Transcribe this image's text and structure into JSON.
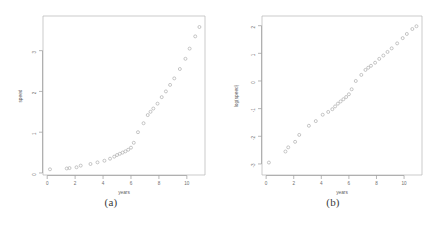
{
  "figure": {
    "panels": [
      {
        "caption": "(a)",
        "xlabel": "years",
        "ylabel": "speed"
      },
      {
        "caption": "(b)",
        "xlabel": "years",
        "ylabel": "log(speed)"
      }
    ]
  },
  "colors": {
    "marker": "#a9a9a9",
    "axis": "#9a9a9a",
    "box": "#b5b5b5",
    "text": "#6d6d6d",
    "background": "#ffffff"
  },
  "chart_data": [
    {
      "type": "scatter",
      "title": "",
      "panel": "(a)",
      "xlabel": "years",
      "ylabel": "speed",
      "xlim": [
        -0.3,
        11.3
      ],
      "ylim": [
        -0.05,
        3.85
      ],
      "xticks": [
        0,
        2,
        4,
        6,
        8,
        10
      ],
      "xticklabels": [
        "0",
        "2",
        "4",
        "6",
        "8",
        "10"
      ],
      "yticks": [
        0,
        1,
        2,
        3
      ],
      "yticklabels": [
        "0",
        "1",
        "2",
        "3"
      ],
      "grid": false,
      "legend": false,
      "marker": "open-circle",
      "x": [
        0.2,
        1.4,
        1.6,
        2.1,
        2.4,
        3.1,
        3.6,
        4.1,
        4.5,
        4.8,
        5.0,
        5.2,
        5.4,
        5.6,
        5.8,
        6.0,
        6.2,
        6.5,
        6.9,
        7.2,
        7.4,
        7.6,
        7.9,
        8.2,
        8.5,
        8.8,
        9.1,
        9.5,
        9.9,
        10.2,
        10.6,
        10.9
      ],
      "y": [
        0.09,
        0.11,
        0.12,
        0.14,
        0.18,
        0.22,
        0.26,
        0.3,
        0.35,
        0.4,
        0.44,
        0.47,
        0.5,
        0.53,
        0.57,
        0.62,
        0.74,
        1.0,
        1.22,
        1.42,
        1.5,
        1.58,
        1.7,
        1.86,
        2.0,
        2.16,
        2.32,
        2.55,
        2.8,
        3.05,
        3.35,
        3.58
      ]
    },
    {
      "type": "scatter",
      "title": "",
      "panel": "(b)",
      "xlabel": "years",
      "ylabel": "log(speed)",
      "xlim": [
        -0.3,
        11.3
      ],
      "ylim": [
        -3.4,
        2.35
      ],
      "xticks": [
        0,
        2,
        4,
        6,
        8,
        10
      ],
      "xticklabels": [
        "0",
        "2",
        "4",
        "6",
        "8",
        "10"
      ],
      "yticks": [
        -3,
        -2,
        -1,
        0,
        1,
        2
      ],
      "yticklabels": [
        "-3",
        "-2",
        "-1",
        "0",
        "1",
        "2"
      ],
      "grid": false,
      "legend": false,
      "marker": "open-circle",
      "x": [
        0.2,
        1.4,
        1.6,
        2.1,
        2.4,
        3.1,
        3.6,
        4.1,
        4.5,
        4.8,
        5.0,
        5.2,
        5.4,
        5.6,
        5.8,
        6.0,
        6.2,
        6.5,
        6.9,
        7.2,
        7.4,
        7.6,
        7.9,
        8.2,
        8.5,
        8.8,
        9.1,
        9.5,
        9.9,
        10.2,
        10.6,
        10.9
      ],
      "y": [
        -2.95,
        -2.55,
        -2.4,
        -2.2,
        -1.95,
        -1.62,
        -1.45,
        -1.22,
        -1.12,
        -1.02,
        -0.92,
        -0.82,
        -0.74,
        -0.66,
        -0.58,
        -0.48,
        -0.3,
        0.0,
        0.22,
        0.4,
        0.48,
        0.55,
        0.66,
        0.8,
        0.92,
        1.05,
        1.18,
        1.36,
        1.55,
        1.7,
        1.88,
        1.98
      ]
    }
  ]
}
